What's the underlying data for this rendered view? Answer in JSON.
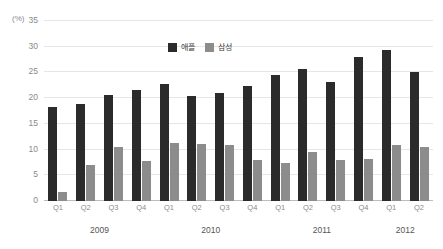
{
  "chart_data": {
    "type": "bar",
    "title": "",
    "xlabel": "",
    "ylabel": "",
    "unit_label": "(%)",
    "ylim": [
      0,
      35
    ],
    "ytick_step": 5,
    "yticks": [
      0,
      5,
      10,
      15,
      20,
      25,
      30,
      35
    ],
    "grid": true,
    "legend_position": "top-center",
    "categories": [
      "Q1",
      "Q2",
      "Q3",
      "Q4",
      "Q1",
      "Q2",
      "Q3",
      "Q4",
      "Q1",
      "Q2",
      "Q3",
      "Q4",
      "Q1",
      "Q2"
    ],
    "group_labels": [
      {
        "label": "2009",
        "start": 0,
        "span": 4
      },
      {
        "label": "2010",
        "start": 4,
        "span": 4
      },
      {
        "label": "2011",
        "start": 8,
        "span": 4
      },
      {
        "label": "2012",
        "start": 12,
        "span": 2
      }
    ],
    "series": [
      {
        "name": "애플",
        "color": "#2b2b2b",
        "values": [
          18.2,
          18.9,
          20.7,
          21.5,
          22.7,
          20.5,
          21.0,
          22.3,
          24.5,
          25.6,
          23.1,
          28.0,
          29.3,
          25.0
        ]
      },
      {
        "name": "삼성",
        "color": "#8c8c8c",
        "values": [
          1.8,
          7.0,
          10.5,
          7.7,
          11.3,
          11.1,
          10.9,
          7.9,
          7.4,
          9.6,
          8.0,
          8.2,
          10.9,
          10.6
        ]
      }
    ]
  }
}
